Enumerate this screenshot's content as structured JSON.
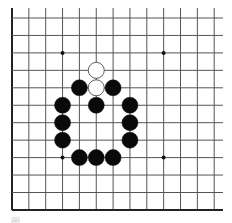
{
  "board": {
    "columns": 13,
    "rows": 12,
    "origin_x": 12,
    "origin_y": 18,
    "spacing_x": 16.85,
    "spacing_y": 17.45,
    "top_extend": 8,
    "right_extend": 223,
    "line_color": "#555555",
    "edge_color": "#222222",
    "edges": [
      "left",
      "bottom"
    ],
    "star_points": [
      [
        3,
        2
      ],
      [
        9,
        2
      ],
      [
        3,
        8
      ],
      [
        9,
        8
      ]
    ],
    "stones": [
      {
        "color": "white",
        "col": 5,
        "row": 3
      },
      {
        "color": "white",
        "col": 5,
        "row": 4
      },
      {
        "color": "black",
        "col": 4,
        "row": 4
      },
      {
        "color": "black",
        "col": 6,
        "row": 4
      },
      {
        "color": "black",
        "col": 3,
        "row": 5
      },
      {
        "color": "black",
        "col": 5,
        "row": 5
      },
      {
        "color": "black",
        "col": 7,
        "row": 5
      },
      {
        "color": "black",
        "col": 3,
        "row": 6
      },
      {
        "color": "black",
        "col": 7,
        "row": 6
      },
      {
        "color": "black",
        "col": 3,
        "row": 7
      },
      {
        "color": "black",
        "col": 7,
        "row": 7
      },
      {
        "color": "black",
        "col": 4,
        "row": 8
      },
      {
        "color": "black",
        "col": 5,
        "row": 8
      },
      {
        "color": "black",
        "col": 6,
        "row": 8
      }
    ]
  },
  "caption": "图"
}
